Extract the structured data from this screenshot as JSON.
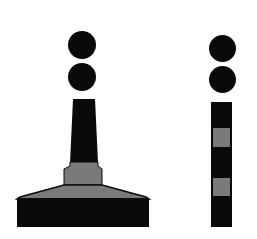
{
  "title": "of marks",
  "colors": {
    "dark": "#0a0a0a",
    "gray": "#7a7a7a",
    "background": "#ffffff"
  },
  "marks": [
    {
      "name": "left-buoy",
      "shape": "spar-on-base",
      "topmark": "two black spheres",
      "bands": [
        "black",
        "gray",
        "black"
      ]
    },
    {
      "name": "right-pillar",
      "shape": "pillar",
      "topmark": "two black spheres",
      "bands": [
        "black",
        "gray",
        "black",
        "gray",
        "black"
      ]
    }
  ]
}
